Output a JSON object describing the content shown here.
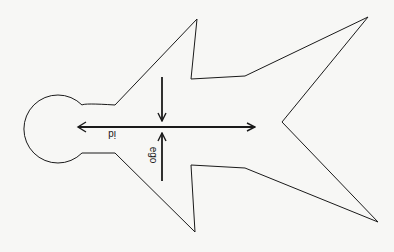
{
  "diagram": {
    "labels": {
      "horizontal_arrow": "id",
      "vertical_arrows": "ego"
    },
    "colors": {
      "background": "#f7f7f5",
      "stroke": "#1a1a1a"
    }
  }
}
